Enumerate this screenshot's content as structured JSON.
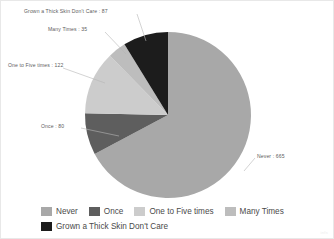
{
  "chart_data": {
    "type": "pie",
    "title": "",
    "categories": [
      "Never",
      "Once",
      "One to Five times",
      "Many Times",
      "Grown a Thick Skin Don't Care"
    ],
    "values": [
      665,
      80,
      122,
      35,
      87
    ],
    "colors": [
      "#a8a8a8",
      "#5e5e5e",
      "#cccccc",
      "#bdbdbd",
      "#1c1c1c"
    ],
    "legend_position": "bottom",
    "grid": false,
    "start_angle_deg": 0,
    "direction": "clockwise",
    "labels_outside": true,
    "callouts": [
      {
        "id": "never",
        "text": "Never : 665"
      },
      {
        "id": "once",
        "text": "Once : 80"
      },
      {
        "id": "onefive",
        "text": "One to Five times : 122"
      },
      {
        "id": "many",
        "text": "Many Times : 35"
      },
      {
        "id": "grown",
        "text": "Grown a Thick Skin Don't Care : 87"
      }
    ]
  },
  "legend": {
    "row1": [
      {
        "label": "Never",
        "color": "#a8a8a8"
      },
      {
        "label": "Once",
        "color": "#5e5e5e"
      },
      {
        "label": "One to Five times",
        "color": "#cccccc"
      },
      {
        "label": "Many Times",
        "color": "#bdbdbd"
      }
    ],
    "row2": [
      {
        "label": "Grown a Thick Skin Don't Care",
        "color": "#1c1c1c"
      }
    ]
  },
  "watermark": {
    "text": "infs"
  }
}
